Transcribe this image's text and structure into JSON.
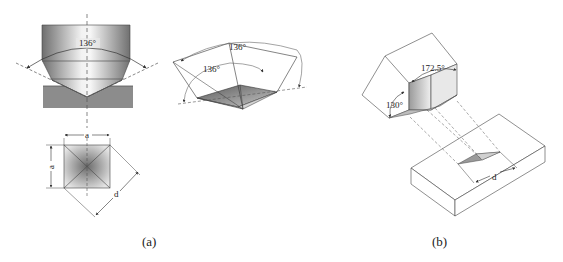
{
  "figure": {
    "panels": [
      {
        "id": "a",
        "caption": "(a)",
        "title": "Vickers indenter",
        "side_view": {
          "angle_label": "136°"
        },
        "perspective_view": {
          "angle_labels": [
            "136°",
            "136°"
          ]
        },
        "indentation_top_view": {
          "side_label_top": "a",
          "side_label_left": "a",
          "diagonal_label": "d"
        }
      },
      {
        "id": "b",
        "caption": "(b)",
        "title": "Knoop indenter",
        "indenter": {
          "angle_long": "172.5°",
          "angle_short": "130°"
        },
        "specimen": {
          "diagonal_label": "d"
        }
      }
    ],
    "colors": {
      "line": "#333333",
      "dashed": "#555555",
      "specimen_fill": "#8c8c8c",
      "face_light": "#e8e8e8",
      "face_dark": "#7a7a7a"
    }
  }
}
